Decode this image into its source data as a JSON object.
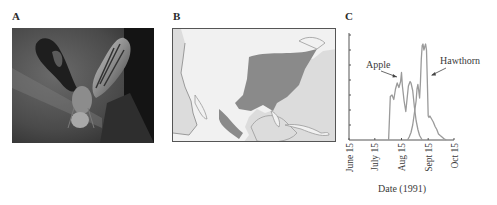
{
  "figure": {
    "panels": [
      {
        "id": "A",
        "label": "A",
        "content": "photograph of fly with patterned wings"
      },
      {
        "id": "B",
        "label": "B",
        "content": "map of North America with shaded range"
      },
      {
        "id": "C",
        "label": "C",
        "content": "line chart of emergence by date"
      }
    ]
  },
  "chart_data": {
    "type": "line",
    "title": "",
    "xlabel": "Date (1991)",
    "ylabel": "",
    "x_tick_labels": [
      "June 15",
      "July 15",
      "Aug 15",
      "Sept 15",
      "Oct 15"
    ],
    "x_tick_days": [
      0,
      30,
      61,
      92,
      122
    ],
    "y_ticks_count": 7,
    "y_tick_labels": [],
    "ylim": [
      0,
      7
    ],
    "grid": false,
    "legend": "annotation labels with arrows",
    "annotations": [
      {
        "text": "Apple",
        "points_to_series": "Apple"
      },
      {
        "text": "Hawthorn",
        "points_to_series": "Hawthorn"
      }
    ],
    "x_units": "days since June 15",
    "series": [
      {
        "name": "Apple",
        "x": [
          46,
          47,
          48,
          50,
          52,
          54,
          56,
          58,
          60,
          61,
          62,
          64,
          66,
          67,
          69,
          71,
          72,
          74,
          76,
          78,
          80,
          82,
          85
        ],
        "y": [
          0,
          1.5,
          2.9,
          3.0,
          2.7,
          3.4,
          3.8,
          3.5,
          3.9,
          4.5,
          3.6,
          2.6,
          1.9,
          2.5,
          3.6,
          3.9,
          3.8,
          3.3,
          2.2,
          1.3,
          0.7,
          0.3,
          0
        ]
      },
      {
        "name": "Hawthorn",
        "x": [
          68,
          70,
          72,
          74,
          76,
          78,
          79,
          80,
          81,
          82,
          83,
          84,
          85,
          86,
          87,
          88,
          89,
          90,
          91,
          92,
          93,
          94,
          96,
          98,
          100,
          102,
          104,
          106,
          108,
          110,
          113
        ],
        "y": [
          0,
          0.2,
          0.5,
          1.0,
          1.8,
          2.6,
          3.4,
          3.7,
          3.3,
          2.8,
          3.8,
          5.4,
          6.3,
          6.4,
          6.0,
          6.2,
          6.4,
          6.0,
          4.0,
          1.6,
          1.5,
          1.6,
          1.4,
          1.2,
          0.9,
          0.7,
          0.4,
          0.3,
          0.2,
          0.1,
          0
        ]
      }
    ]
  }
}
